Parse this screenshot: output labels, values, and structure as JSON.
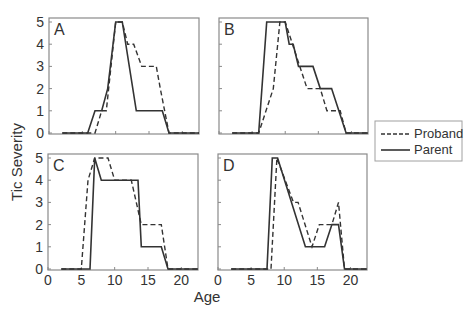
{
  "chart_data": {
    "type": "line",
    "layout": "2x2 small multiples",
    "ylabel": "Tic Severity",
    "xlabel": "Age",
    "xlim": [
      0,
      22.5
    ],
    "ylim": [
      0,
      5
    ],
    "xticks": [
      0,
      5,
      10,
      15,
      20
    ],
    "yticks": [
      0,
      1,
      2,
      3,
      4,
      5
    ],
    "grid": false,
    "legend": {
      "position": "right-middle",
      "entries": [
        {
          "name": "Proband",
          "style": "dashed"
        },
        {
          "name": "Parent",
          "style": "solid"
        }
      ]
    },
    "panels": [
      {
        "label": "A",
        "series": [
          {
            "name": "Proband",
            "style": "dashed",
            "x": [
              2,
              6.9,
              7.9,
              8.6,
              10,
              11,
              11.8,
              12.7,
              13.9,
              16.1,
              16.7,
              18,
              22.5
            ],
            "y": [
              0,
              0,
              1,
              1,
              5,
              5,
              4,
              4,
              3,
              3,
              2,
              0,
              0
            ]
          },
          {
            "name": "Parent",
            "style": "solid",
            "x": [
              2,
              5.8,
              6.9,
              7.9,
              8.8,
              10,
              11,
              13.1,
              17,
              18,
              22.5
            ],
            "y": [
              0,
              0,
              1,
              1,
              2,
              5,
              5,
              1,
              1,
              0,
              0
            ]
          }
        ]
      },
      {
        "label": "B",
        "series": [
          {
            "name": "Proband",
            "style": "dashed",
            "x": [
              2,
              6,
              8.2,
              9.2,
              10,
              13.3,
              15.3,
              16.3,
              18.3,
              19.2,
              22.5
            ],
            "y": [
              0,
              0,
              2,
              5,
              5,
              2,
              2,
              1,
              1,
              0,
              0
            ]
          },
          {
            "name": "Parent",
            "style": "solid",
            "x": [
              2,
              6,
              7.2,
              10,
              10.6,
              11.2,
              12,
              14.2,
              15.3,
              17,
              19.2,
              22.5
            ],
            "y": [
              0,
              0,
              5,
              5,
              4,
              4,
              3,
              3,
              2,
              2,
              0,
              0
            ]
          }
        ]
      },
      {
        "label": "C",
        "series": [
          {
            "name": "Proband",
            "style": "dashed",
            "x": [
              2,
              5,
              6,
              7,
              9,
              10,
              12.5,
              14,
              17,
              18,
              22.5
            ],
            "y": [
              0,
              0,
              4,
              5,
              5,
              4,
              4,
              2,
              2,
              0,
              0
            ]
          },
          {
            "name": "Parent",
            "style": "solid",
            "x": [
              2,
              6.3,
              7,
              8,
              13.5,
              14,
              17,
              18,
              22.5
            ],
            "y": [
              0,
              0,
              5,
              4,
              4,
              1,
              1,
              0,
              0
            ]
          }
        ]
      },
      {
        "label": "D",
        "series": [
          {
            "name": "Proband",
            "style": "dashed",
            "x": [
              2,
              8,
              8.9,
              11.4,
              12.1,
              14.2,
              15.3,
              17.2,
              18.2,
              19.1,
              22.5
            ],
            "y": [
              0,
              0,
              5,
              3,
              3,
              1,
              2,
              2,
              3,
              0,
              0
            ]
          },
          {
            "name": "Parent",
            "style": "solid",
            "x": [
              2,
              7.4,
              8.2,
              9,
              13.2,
              16.1,
              17.2,
              18.2,
              19.1,
              22.5
            ],
            "y": [
              0,
              0,
              5,
              5,
              1,
              1,
              2,
              2,
              0,
              0
            ]
          }
        ]
      }
    ]
  }
}
